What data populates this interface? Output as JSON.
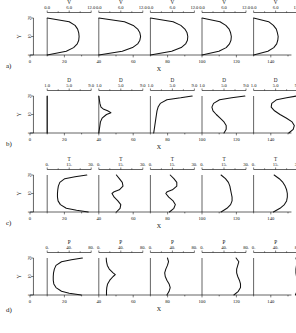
{
  "figure": {
    "panels": [
      {
        "tag": "a)",
        "variable": "V",
        "top_ticks": [
          "0.0",
          "6.0",
          "12.0"
        ],
        "top_range": [
          0.0,
          12.0
        ],
        "x_axis_label": "X",
        "y_axis_label": "Y",
        "x_ticks": [
          "0",
          "20",
          "40",
          "60",
          "80",
          "100",
          "120",
          "140"
        ],
        "y_ticks": [
          "0",
          "10",
          "20"
        ]
      },
      {
        "tag": "b)",
        "variable": "D",
        "top_ticks": [
          "1.0",
          "5.0",
          "9.0"
        ],
        "top_range": [
          1.0,
          9.0
        ],
        "x_axis_label": "X",
        "y_axis_label": "Y",
        "x_ticks": [
          "0",
          "20",
          "40",
          "60",
          "80",
          "100",
          "120",
          "140"
        ],
        "y_ticks": [
          "0",
          "10",
          "20"
        ]
      },
      {
        "tag": "c)",
        "variable": "T",
        "top_ticks": [
          "0.",
          "15.",
          "30."
        ],
        "top_range": [
          0.0,
          30.0
        ],
        "x_axis_label": "X",
        "y_axis_label": "Y",
        "x_ticks": [
          "0",
          "20",
          "40",
          "60",
          "80",
          "100",
          "120",
          "140"
        ],
        "y_ticks": [
          "0",
          "10",
          "20"
        ]
      },
      {
        "tag": "d)",
        "variable": "P",
        "top_ticks": [
          "0.",
          "40.",
          "80."
        ],
        "top_range": [
          0.0,
          80.0
        ],
        "x_axis_label": "X",
        "y_axis_label": "Y",
        "x_ticks": [
          "0",
          "20",
          "40",
          "60",
          "80",
          "100",
          "120",
          "140"
        ],
        "y_ticks": [
          "0",
          "10",
          "20"
        ]
      }
    ]
  },
  "chart_data": [
    {
      "type": "line",
      "title": "",
      "panel": "a",
      "xlabel": "X",
      "ylabel": "Y",
      "variable": "V",
      "xlim": [
        0,
        150
      ],
      "ylim": [
        0,
        22
      ],
      "vlim": [
        0.0,
        12.0
      ],
      "grid": false,
      "legend": "none",
      "stations": [
        {
          "x_station": 10,
          "y": [
            0,
            2,
            4,
            6,
            8,
            10,
            12,
            14,
            16,
            18,
            20
          ],
          "v": [
            0.0,
            5.2,
            7.2,
            8.2,
            8.6,
            8.7,
            8.6,
            8.3,
            7.6,
            6.0,
            0.0
          ]
        },
        {
          "x_station": 40,
          "y": [
            0,
            2,
            4,
            6,
            8,
            10,
            12,
            14,
            16,
            18,
            20
          ],
          "v": [
            0.0,
            6.4,
            9.2,
            10.6,
            11.2,
            11.4,
            11.2,
            10.6,
            9.4,
            7.0,
            0.0
          ]
        },
        {
          "x_station": 70,
          "y": [
            0,
            2,
            4,
            6,
            8,
            10,
            12,
            14,
            16,
            18,
            20
          ],
          "v": [
            0.0,
            5.8,
            8.4,
            9.6,
            10.1,
            10.2,
            10.0,
            9.4,
            8.3,
            6.2,
            0.0
          ]
        },
        {
          "x_station": 100,
          "y": [
            0,
            2,
            4,
            6,
            8,
            10,
            12,
            14,
            16,
            18,
            20
          ],
          "v": [
            0.0,
            4.6,
            6.6,
            7.5,
            7.9,
            8.0,
            7.8,
            7.4,
            6.5,
            4.9,
            0.0
          ]
        },
        {
          "x_station": 130,
          "y": [
            0,
            2,
            4,
            6,
            8,
            10,
            12,
            14,
            16,
            18,
            20
          ],
          "v": [
            0.0,
            3.9,
            5.5,
            6.3,
            6.6,
            6.7,
            6.5,
            6.2,
            5.4,
            4.1,
            0.0
          ]
        }
      ]
    },
    {
      "type": "line",
      "title": "",
      "panel": "b",
      "xlabel": "X",
      "ylabel": "Y",
      "variable": "D",
      "xlim": [
        0,
        150
      ],
      "ylim": [
        0,
        22
      ],
      "vlim": [
        1.0,
        9.0
      ],
      "grid": false,
      "legend": "none",
      "stations": [
        {
          "x_station": 10,
          "y": [
            0,
            2,
            4,
            6,
            8,
            10,
            12,
            14,
            16,
            18,
            20
          ],
          "v": [
            1.0,
            1.0,
            1.0,
            1.0,
            1.0,
            1.0,
            1.0,
            1.0,
            1.0,
            1.0,
            1.0
          ]
        },
        {
          "x_station": 40,
          "y": [
            0,
            2,
            4,
            6,
            8,
            10,
            11,
            12,
            13,
            14,
            16,
            18,
            20
          ],
          "v": [
            1.0,
            1.1,
            1.2,
            1.3,
            1.6,
            2.4,
            3.2,
            2.6,
            1.8,
            1.4,
            1.2,
            1.1,
            1.0
          ]
        },
        {
          "x_station": 70,
          "y": [
            0,
            2,
            4,
            6,
            8,
            10,
            12,
            14,
            16,
            18,
            19,
            20
          ],
          "v": [
            1.6,
            1.7,
            1.8,
            1.9,
            2.0,
            2.1,
            2.2,
            2.4,
            2.8,
            4.0,
            6.5,
            8.6
          ]
        },
        {
          "x_station": 100,
          "y": [
            0,
            2,
            4,
            6,
            8,
            10,
            12,
            14,
            16,
            18,
            19,
            20
          ],
          "v": [
            5.0,
            5.4,
            5.4,
            5.0,
            4.3,
            3.6,
            3.0,
            2.8,
            3.1,
            4.2,
            6.4,
            8.8
          ]
        },
        {
          "x_station": 130,
          "y": [
            0,
            2,
            4,
            6,
            8,
            10,
            12,
            14,
            16,
            18,
            19,
            20
          ],
          "v": [
            7.4,
            8.2,
            8.4,
            8.0,
            7.0,
            5.8,
            4.8,
            4.2,
            4.3,
            5.2,
            7.0,
            8.8
          ]
        }
      ]
    },
    {
      "type": "line",
      "title": "",
      "panel": "c",
      "xlabel": "X",
      "ylabel": "Y",
      "variable": "T",
      "xlim": [
        0,
        150
      ],
      "ylim": [
        0,
        22
      ],
      "vlim": [
        0.0,
        30.0
      ],
      "grid": false,
      "legend": "none",
      "stations": [
        {
          "x_station": 10,
          "y": [
            0,
            1,
            2,
            4,
            6,
            8,
            10,
            12,
            14,
            16,
            18,
            19,
            20
          ],
          "v": [
            28.0,
            20.0,
            13.0,
            9.0,
            7.4,
            7.0,
            7.0,
            7.2,
            7.6,
            8.6,
            12.0,
            19.0,
            27.0
          ]
        },
        {
          "x_station": 40,
          "y": [
            0,
            2,
            4,
            6,
            8,
            10,
            11,
            12,
            14,
            16,
            18,
            20
          ],
          "v": [
            12.0,
            14.5,
            15.0,
            13.0,
            10.5,
            9.0,
            10.5,
            14.0,
            16.5,
            16.0,
            14.0,
            12.0
          ]
        },
        {
          "x_station": 70,
          "y": [
            0,
            2,
            4,
            6,
            8,
            10,
            11,
            12,
            14,
            16,
            18,
            20
          ],
          "v": [
            13.0,
            16.0,
            17.0,
            15.5,
            12.5,
            10.5,
            11.5,
            15.0,
            18.0,
            18.0,
            16.0,
            13.5
          ]
        },
        {
          "x_station": 100,
          "y": [
            0,
            2,
            4,
            6,
            8,
            10,
            12,
            14,
            16,
            18,
            20
          ],
          "v": [
            13.0,
            17.0,
            19.5,
            20.5,
            20.5,
            20.0,
            19.5,
            19.0,
            18.0,
            16.0,
            13.0
          ]
        },
        {
          "x_station": 130,
          "y": [
            0,
            2,
            4,
            6,
            8,
            10,
            12,
            14,
            16,
            18,
            20
          ],
          "v": [
            13.5,
            18.0,
            21.0,
            22.5,
            23.0,
            23.0,
            22.5,
            21.5,
            20.0,
            17.5,
            14.0
          ]
        }
      ]
    },
    {
      "type": "line",
      "title": "",
      "panel": "d",
      "xlabel": "X",
      "ylabel": "Y",
      "variable": "P",
      "xlim": [
        0,
        150
      ],
      "ylim": [
        0,
        22
      ],
      "vlim": [
        0.0,
        80.0
      ],
      "grid": false,
      "legend": "none",
      "stations": [
        {
          "x_station": 10,
          "y": [
            0,
            1,
            2,
            4,
            6,
            8,
            10,
            12,
            14,
            16,
            18,
            19,
            20
          ],
          "v": [
            62.0,
            40.0,
            26.0,
            16.0,
            12.0,
            11.0,
            11.0,
            11.5,
            13.0,
            16.0,
            26.0,
            44.0,
            64.0
          ]
        },
        {
          "x_station": 40,
          "y": [
            0,
            2,
            4,
            6,
            8,
            10,
            11,
            12,
            14,
            16,
            18,
            20
          ],
          "v": [
            14.0,
            14.0,
            14.5,
            16.0,
            20.0,
            26.0,
            30.0,
            26.0,
            19.0,
            15.5,
            14.0,
            13.5
          ]
        },
        {
          "x_station": 70,
          "y": [
            0,
            2,
            4,
            6,
            8,
            10,
            12,
            14,
            16,
            18,
            20
          ],
          "v": [
            30.0,
            34.0,
            36.0,
            34.0,
            30.0,
            27.0,
            26.0,
            28.0,
            31.0,
            33.0,
            31.0
          ]
        },
        {
          "x_station": 100,
          "y": [
            0,
            2,
            4,
            6,
            8,
            10,
            12,
            14,
            16,
            18,
            20
          ],
          "v": [
            58.0,
            66.0,
            70.0,
            70.0,
            68.0,
            65.0,
            63.0,
            63.0,
            65.0,
            67.0,
            62.0
          ]
        },
        {
          "x_station": 130,
          "y": [
            0,
            2,
            4,
            6,
            8,
            10,
            12,
            14,
            16,
            18,
            20
          ],
          "v": [
            76.0,
            79.0,
            80.0,
            80.0,
            79.0,
            78.0,
            77.0,
            77.0,
            78.0,
            79.0,
            77.0
          ]
        }
      ]
    }
  ]
}
